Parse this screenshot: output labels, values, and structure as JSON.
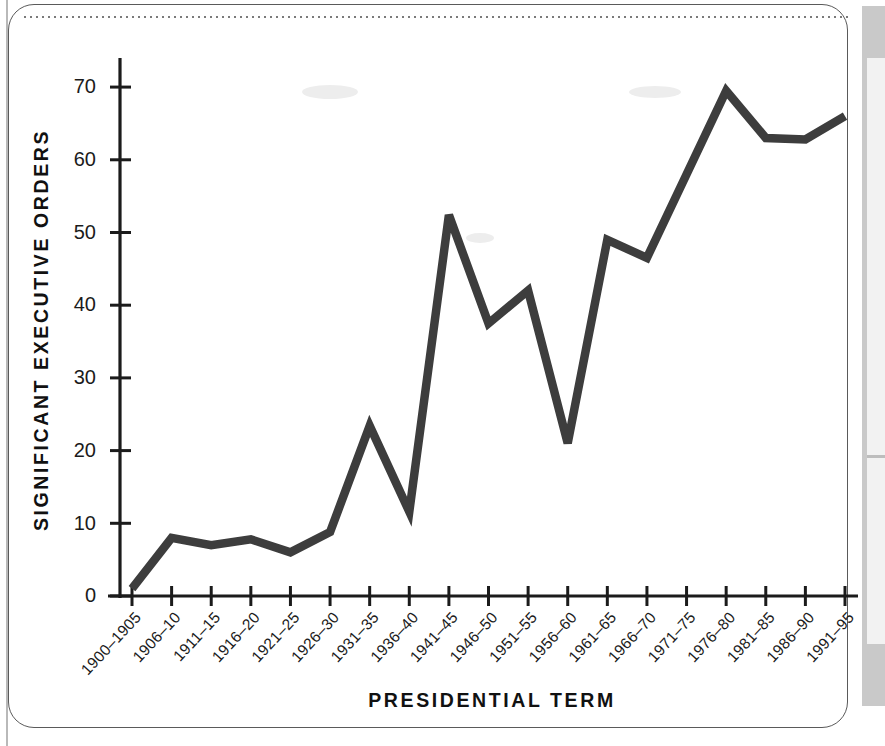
{
  "figure": {
    "frame_color": "#5a5a5a",
    "background": "#ffffff",
    "line_color": "#3d3d3d",
    "axis_color": "#1b1b1b"
  },
  "chart_data": {
    "type": "line",
    "title": "",
    "xlabel": "PRESIDENTIAL TERM",
    "ylabel": "SIGNIFICANT EXECUTIVE ORDERS",
    "ylim": [
      0,
      74
    ],
    "yticks": [
      0,
      10,
      20,
      30,
      40,
      50,
      60,
      70
    ],
    "ytick_labels": [
      "0",
      "10",
      "20",
      "30",
      "40",
      "50",
      "60",
      "70"
    ],
    "grid": false,
    "legend": null,
    "categories": [
      "1900–1905",
      "1906–10",
      "1911–15",
      "1916–20",
      "1921–25",
      "1926–30",
      "1931–35",
      "1936–40",
      "1941–45",
      "1946–50",
      "1951–55",
      "1956–60",
      "1961–65",
      "1966–70",
      "1971–75",
      "1976–80",
      "1981–85",
      "1986–90",
      "1991–95"
    ],
    "values": [
      1,
      8,
      7,
      7.8,
      6,
      8.8,
      23.4,
      11.6,
      52.4,
      37.5,
      42,
      21,
      49,
      46.5,
      58,
      69.5,
      63,
      62.8,
      66
    ]
  }
}
